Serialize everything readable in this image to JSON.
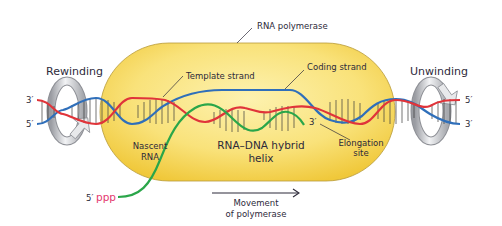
{
  "diagram": {
    "colors": {
      "background": "#ffffff",
      "polymerase_fill_light": "#fbe98a",
      "polymerase_fill_dark": "#f2cd3e",
      "polymerase_outline": "#b08a2a",
      "template_strand": "#e0343a",
      "coding_strand": "#2f6fba",
      "rna": "#2aa64a",
      "ppp": "#e4386e",
      "rungs": "#3a3a3a",
      "arrow_fill": "#dcdde0",
      "text": "#2d2a3a"
    },
    "labels": {
      "rna_polymerase": "RNA polymerase",
      "rewinding": "Rewinding",
      "unwinding": "Unwinding",
      "template_strand": "Template strand",
      "coding_strand": "Coding strand",
      "nascent_rna_line1": "Nascent",
      "nascent_rna_line2": "RNA",
      "hybrid_line1": "RNA–DNA hybrid",
      "hybrid_line2": "helix",
      "elongation_line1": "Elongation",
      "elongation_line2": "site",
      "movement_line1": "Movement",
      "movement_line2": "of polymerase",
      "left_top_end": "3′",
      "left_bottom_end": "5′",
      "right_top_end": "5′",
      "right_bottom_end": "3′",
      "rna_3_end": "3′",
      "rna_5_end": "5′",
      "ppp": "ppp"
    }
  }
}
